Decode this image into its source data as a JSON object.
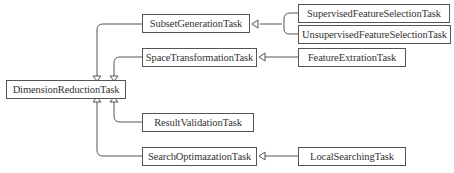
{
  "diagram": {
    "type": "uml-class-inheritance",
    "colors": {
      "line": "#555555",
      "box_border": "#555555",
      "text": "#333333",
      "background": "#ffffff"
    },
    "nodes": {
      "root": {
        "id": "DimensionReductionTask",
        "label": "DimensionReductionTask"
      },
      "subset": {
        "id": "SubsetGenerationTask",
        "label": "SubsetGenerationTask"
      },
      "space": {
        "id": "SpaceTransformationTask",
        "label": "SpaceTransformationTask"
      },
      "result": {
        "id": "ResultValidationTask",
        "label": "ResultValidationTask"
      },
      "search": {
        "id": "SearchOptimazationTask",
        "label": "SearchOptimazationTask"
      },
      "supervised": {
        "id": "SupervisedFeatureSelectionTask",
        "label": "SupervisedFeatureSelectionTask"
      },
      "unsupervised": {
        "id": "UnsupervisedFeatureSelectionTask",
        "label": "UnsupervisedFeatureSelectionTask"
      },
      "extraction": {
        "id": "FeatureExtrationTask",
        "label": "FeatureExtrationTask"
      },
      "local": {
        "id": "LocalSearchingTask",
        "label": "LocalSearchingTask"
      }
    },
    "edges": [
      {
        "from": "SubsetGenerationTask",
        "to": "DimensionReductionTask",
        "kind": "generalization"
      },
      {
        "from": "SpaceTransformationTask",
        "to": "DimensionReductionTask",
        "kind": "generalization"
      },
      {
        "from": "ResultValidationTask",
        "to": "DimensionReductionTask",
        "kind": "generalization"
      },
      {
        "from": "SearchOptimazationTask",
        "to": "DimensionReductionTask",
        "kind": "generalization"
      },
      {
        "from": "SupervisedFeatureSelectionTask",
        "to": "SubsetGenerationTask",
        "kind": "generalization"
      },
      {
        "from": "UnsupervisedFeatureSelectionTask",
        "to": "SubsetGenerationTask",
        "kind": "generalization"
      },
      {
        "from": "FeatureExtrationTask",
        "to": "SpaceTransformationTask",
        "kind": "generalization"
      },
      {
        "from": "LocalSearchingTask",
        "to": "SearchOptimazationTask",
        "kind": "generalization"
      }
    ]
  }
}
